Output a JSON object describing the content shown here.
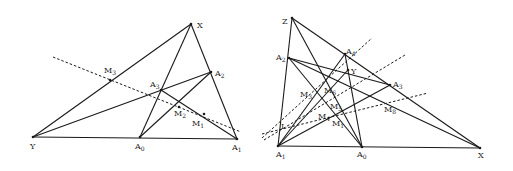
{
  "figures": [
    {
      "id": "left",
      "points": {
        "X": [
          191,
          24
        ],
        "Y": [
          33,
          137
        ],
        "A0": [
          140,
          137
        ],
        "A1": [
          237,
          139
        ],
        "A2": [
          211,
          72
        ],
        "A3": [
          161,
          90
        ],
        "M1": [
          204,
          114
        ],
        "M2": [
          179,
          107
        ],
        "M3": [
          110,
          80
        ]
      },
      "segments": [
        [
          "X",
          "Y"
        ],
        [
          "X",
          "A1"
        ],
        [
          "Y",
          "A1"
        ],
        [
          "X",
          "A0"
        ],
        [
          "A0",
          "A2"
        ],
        [
          "Y",
          "A2"
        ],
        [
          "A3",
          "A1"
        ]
      ],
      "dashed": [
        [
          [
            53,
            57
          ],
          [
            241,
            132
          ]
        ]
      ],
      "labels": [
        {
          "text": "X",
          "sub": "",
          "x": 197,
          "y": 28
        },
        {
          "text": "Y",
          "sub": "",
          "x": 30,
          "y": 149
        },
        {
          "text": "A",
          "sub": "0",
          "x": 135,
          "y": 149
        },
        {
          "text": "A",
          "sub": "1",
          "x": 232,
          "y": 150
        },
        {
          "text": "A",
          "sub": "2",
          "x": 215,
          "y": 76
        },
        {
          "text": "A",
          "sub": "3",
          "x": 150,
          "y": 87
        },
        {
          "text": "M",
          "sub": "1",
          "x": 192,
          "y": 126
        },
        {
          "text": "M",
          "sub": "2",
          "x": 174,
          "y": 116
        },
        {
          "text": "M",
          "sub": "3",
          "x": 104,
          "y": 73
        }
      ]
    },
    {
      "id": "right",
      "points": {
        "Z": [
          292,
          18
        ],
        "A1": [
          278,
          146
        ],
        "X": [
          480,
          148
        ],
        "A0": [
          362,
          147
        ],
        "A2": [
          289,
          58
        ],
        "A3": [
          390,
          85
        ],
        "A4": [
          345,
          54
        ],
        "Y": [
          348,
          70
        ]
      },
      "segments": [
        [
          "Z",
          "A1"
        ],
        [
          "Z",
          "X"
        ],
        [
          "A1",
          "X"
        ],
        [
          "Z",
          "A0"
        ],
        [
          "A2",
          "A0"
        ],
        [
          "A2",
          "X"
        ],
        [
          "A2",
          "A3"
        ],
        [
          "A1",
          "A4"
        ],
        [
          "A4",
          "A0"
        ],
        [
          "A1",
          "A3"
        ],
        [
          "A1",
          "Y"
        ]
      ],
      "dashed": [
        [
          [
            262,
            138
          ],
          [
            372,
            38
          ]
        ],
        [
          [
            264,
            140
          ],
          [
            405,
            55
          ]
        ],
        [
          [
            262,
            134
          ],
          [
            428,
            93
          ]
        ]
      ],
      "labels": [
        {
          "text": "Z",
          "sub": "",
          "x": 282,
          "y": 24
        },
        {
          "text": "A",
          "sub": "1",
          "x": 276,
          "y": 157
        },
        {
          "text": "X",
          "sub": "",
          "x": 478,
          "y": 158
        },
        {
          "text": "A",
          "sub": "0",
          "x": 357,
          "y": 157
        },
        {
          "text": "A",
          "sub": "2",
          "x": 276,
          "y": 60
        },
        {
          "text": "A",
          "sub": "3",
          "x": 393,
          "y": 87
        },
        {
          "text": "A",
          "sub": "4",
          "x": 346,
          "y": 54
        },
        {
          "text": "Y",
          "sub": "",
          "x": 351,
          "y": 74
        },
        {
          "text": "M",
          "sub": "1",
          "x": 332,
          "y": 126
        },
        {
          "text": "M",
          "sub": "3",
          "x": 300,
          "y": 97
        },
        {
          "text": "M",
          "sub": "4",
          "x": 318,
          "y": 119
        },
        {
          "text": "M",
          "sub": "5",
          "x": 330,
          "y": 109
        },
        {
          "text": "M",
          "sub": "6",
          "x": 324,
          "y": 93
        },
        {
          "text": "M",
          "sub": "8",
          "x": 384,
          "y": 112
        },
        {
          "text": "I",
          "sub": "",
          "x": 281,
          "y": 129
        }
      ]
    }
  ]
}
